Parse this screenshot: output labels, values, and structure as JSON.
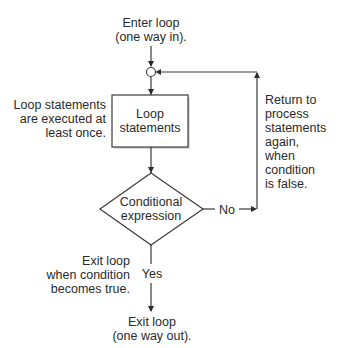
{
  "diagram": {
    "type": "flowchart",
    "entry_label": [
      "Enter loop",
      "(one way in)."
    ],
    "left_note": [
      "Loop statements",
      "are executed at",
      "least once."
    ],
    "process_box": [
      "Loop",
      "statements"
    ],
    "decision": [
      "Conditional",
      "expression"
    ],
    "no_label": "No",
    "yes_label": "Yes",
    "return_note": [
      "Return to",
      "process",
      "statements",
      "again,",
      "when",
      "condition",
      "is false."
    ],
    "exit_note": [
      "Exit loop",
      "when condition",
      "becomes true."
    ],
    "exit_label": [
      "Exit loop",
      "(one way out)."
    ]
  },
  "colors": {
    "line": "#3a3a3a",
    "text": "#2a2a2a",
    "background": "#ffffff"
  }
}
